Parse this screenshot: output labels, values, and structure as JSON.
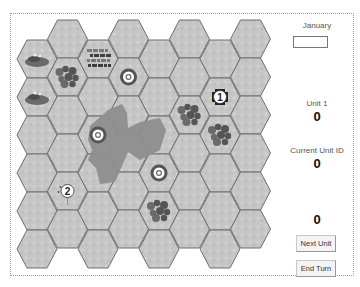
{
  "panel": {
    "month_label": "January",
    "month_value": "",
    "unit_label": "Unit 1",
    "unit_value": "0",
    "current_unit_label": "Current Unit ID",
    "current_unit_value": "0",
    "extra_value": "0",
    "next_unit_label": "Next Unit",
    "end_turn_label": "End Turn"
  },
  "board": {
    "columns": 8,
    "rows": 6,
    "colors": {
      "hex_fill": "#c9c9c9",
      "hex_stroke": "#6e6e6e",
      "lake": "#8c8c8c",
      "forest": "#5a5a5a",
      "rough": "#4a4a4a",
      "target_ring": "#555555"
    },
    "terrain": [
      {
        "col": 0,
        "row": 0,
        "type": "hills"
      },
      {
        "col": 0,
        "row": 1,
        "type": "hills"
      },
      {
        "col": 1,
        "row": 1,
        "type": "forest"
      },
      {
        "col": 2,
        "row": 0,
        "type": "rough"
      },
      {
        "col": 5,
        "row": 2,
        "type": "forest"
      },
      {
        "col": 6,
        "row": 2,
        "type": "forest"
      },
      {
        "col": 4,
        "row": 4,
        "type": "forest"
      }
    ],
    "targets": [
      {
        "col": 3,
        "row": 1
      },
      {
        "col": 2,
        "row": 2
      },
      {
        "col": 4,
        "row": 3
      }
    ],
    "units": [
      {
        "id": "1",
        "col": 6,
        "row": 1,
        "style": "fort"
      },
      {
        "id": "2",
        "col": 1,
        "row": 4,
        "style": "village"
      }
    ]
  }
}
